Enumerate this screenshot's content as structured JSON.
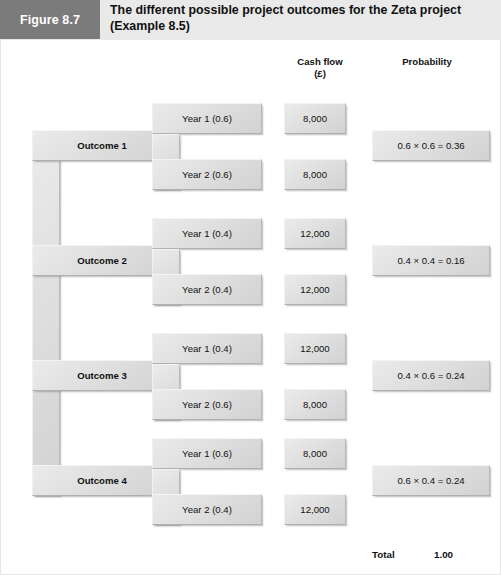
{
  "figure": {
    "label": "Figure 8.7",
    "title_line1": "The different possible project outcomes for the Zeta project",
    "title_line2": "(Example 8.5)"
  },
  "columns": {
    "cash_flow_line1": "Cash flow",
    "cash_flow_line2": "(£)",
    "probability": "Probability"
  },
  "outcomes": [
    {
      "name": "Outcome 1",
      "year1_label": "Year 1 (0.6)",
      "year1_cash": "8,000",
      "year2_label": "Year 2 (0.6)",
      "year2_cash": "8,000",
      "probability": "0.6 × 0.6 = 0.36"
    },
    {
      "name": "Outcome 2",
      "year1_label": "Year 1 (0.4)",
      "year1_cash": "12,000",
      "year2_label": "Year 2 (0.4)",
      "year2_cash": "12,000",
      "probability": "0.4 × 0.4 = 0.16"
    },
    {
      "name": "Outcome 3",
      "year1_label": "Year 1 (0.4)",
      "year1_cash": "12,000",
      "year2_label": "Year 2 (0.6)",
      "year2_cash": "8,000",
      "probability": "0.4 × 0.6 = 0.24"
    },
    {
      "name": "Outcome 4",
      "year1_label": "Year 1 (0.6)",
      "year1_cash": "8,000",
      "year2_label": "Year 2 (0.4)",
      "year2_cash": "12,000",
      "probability": "0.6 × 0.4 = 0.24"
    }
  ],
  "total": {
    "label": "Total",
    "value": "1.00"
  },
  "colors": {
    "figure_label_bg": "#7b7b7b",
    "title_bar_bg": "#e9e9e9",
    "plate_face": "#dddddd",
    "page_bg": "#ffffff"
  }
}
